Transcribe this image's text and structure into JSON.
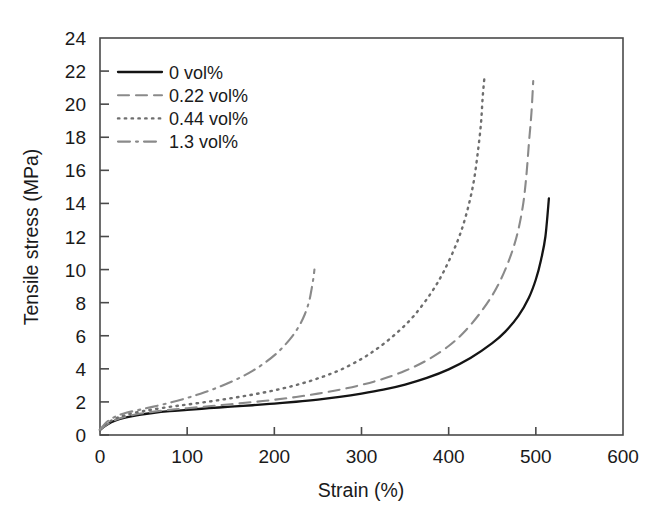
{
  "chart_data": {
    "type": "line",
    "title": "",
    "xlabel": "Strain (%)",
    "ylabel": "Tensile stress (MPa)",
    "xlim": [
      0,
      600
    ],
    "ylim": [
      0,
      24
    ],
    "xticks": [
      0,
      100,
      200,
      300,
      400,
      500,
      600
    ],
    "yticks": [
      0,
      2,
      4,
      6,
      8,
      10,
      12,
      14,
      16,
      18,
      20,
      22,
      24
    ],
    "xtick_labels": [
      "0",
      "100",
      "200",
      "300",
      "400",
      "500",
      "600"
    ],
    "ytick_labels": [
      "0",
      "2",
      "4",
      "6",
      "8",
      "10",
      "12",
      "14",
      "16",
      "18",
      "20",
      "22",
      "24"
    ],
    "grid": false,
    "legend_position": "upper left",
    "series": [
      {
        "name": "0 vol%",
        "style": "solid",
        "color": "#141414",
        "width": 2.3,
        "points": [
          [
            0,
            0.3
          ],
          [
            8,
            0.62
          ],
          [
            18,
            0.88
          ],
          [
            30,
            1.06
          ],
          [
            45,
            1.22
          ],
          [
            60,
            1.33
          ],
          [
            80,
            1.44
          ],
          [
            100,
            1.52
          ],
          [
            125,
            1.62
          ],
          [
            150,
            1.71
          ],
          [
            175,
            1.8
          ],
          [
            200,
            1.9
          ],
          [
            225,
            2.01
          ],
          [
            250,
            2.14
          ],
          [
            275,
            2.3
          ],
          [
            300,
            2.5
          ],
          [
            325,
            2.74
          ],
          [
            350,
            3.05
          ],
          [
            375,
            3.45
          ],
          [
            400,
            3.97
          ],
          [
            425,
            4.65
          ],
          [
            450,
            5.55
          ],
          [
            465,
            6.25
          ],
          [
            480,
            7.2
          ],
          [
            492,
            8.3
          ],
          [
            500,
            9.4
          ],
          [
            506,
            10.6
          ],
          [
            511,
            12.0
          ],
          [
            515,
            14.3
          ]
        ]
      },
      {
        "name": "0.22 vol%",
        "style": "dashed",
        "color": "#8a8a8a",
        "width": 2.1,
        "points": [
          [
            0,
            0.3
          ],
          [
            8,
            0.64
          ],
          [
            18,
            0.92
          ],
          [
            30,
            1.12
          ],
          [
            45,
            1.28
          ],
          [
            60,
            1.4
          ],
          [
            80,
            1.52
          ],
          [
            100,
            1.62
          ],
          [
            125,
            1.74
          ],
          [
            150,
            1.86
          ],
          [
            175,
            1.99
          ],
          [
            200,
            2.13
          ],
          [
            225,
            2.3
          ],
          [
            250,
            2.5
          ],
          [
            275,
            2.74
          ],
          [
            300,
            3.03
          ],
          [
            325,
            3.4
          ],
          [
            350,
            3.88
          ],
          [
            375,
            4.52
          ],
          [
            400,
            5.38
          ],
          [
            420,
            6.35
          ],
          [
            440,
            7.65
          ],
          [
            455,
            8.9
          ],
          [
            468,
            10.4
          ],
          [
            478,
            12.0
          ],
          [
            485,
            13.8
          ],
          [
            489,
            15.6
          ],
          [
            492,
            17.6
          ],
          [
            495,
            19.5
          ],
          [
            497,
            21.4
          ]
        ]
      },
      {
        "name": "0.44 vol%",
        "style": "dotted",
        "color": "#6e6e6e",
        "width": 2.4,
        "points": [
          [
            0,
            0.32
          ],
          [
            8,
            0.7
          ],
          [
            18,
            1.0
          ],
          [
            30,
            1.22
          ],
          [
            45,
            1.4
          ],
          [
            60,
            1.54
          ],
          [
            80,
            1.7
          ],
          [
            100,
            1.84
          ],
          [
            125,
            2.02
          ],
          [
            150,
            2.22
          ],
          [
            175,
            2.44
          ],
          [
            200,
            2.7
          ],
          [
            225,
            3.02
          ],
          [
            250,
            3.42
          ],
          [
            275,
            3.92
          ],
          [
            300,
            4.6
          ],
          [
            320,
            5.3
          ],
          [
            340,
            6.15
          ],
          [
            360,
            7.2
          ],
          [
            380,
            8.6
          ],
          [
            395,
            9.95
          ],
          [
            410,
            11.7
          ],
          [
            420,
            13.3
          ],
          [
            428,
            15.1
          ],
          [
            433,
            16.9
          ],
          [
            437,
            18.8
          ],
          [
            439,
            20.4
          ],
          [
            441,
            21.6
          ]
        ]
      },
      {
        "name": "1.3 vol%",
        "style": "dashdot",
        "color": "#8a8a8a",
        "width": 2.1,
        "points": [
          [
            0,
            0.34
          ],
          [
            8,
            0.8
          ],
          [
            18,
            1.12
          ],
          [
            30,
            1.34
          ],
          [
            45,
            1.52
          ],
          [
            60,
            1.7
          ],
          [
            80,
            1.95
          ],
          [
            100,
            2.24
          ],
          [
            120,
            2.58
          ],
          [
            140,
            2.98
          ],
          [
            160,
            3.45
          ],
          [
            175,
            3.88
          ],
          [
            190,
            4.4
          ],
          [
            205,
            5.05
          ],
          [
            218,
            5.8
          ],
          [
            228,
            6.55
          ],
          [
            235,
            7.3
          ],
          [
            240,
            8.1
          ],
          [
            243,
            8.9
          ],
          [
            245,
            9.55
          ],
          [
            246,
            10.0
          ]
        ]
      }
    ]
  },
  "legend": {
    "entries": [
      {
        "label": "0 vol%",
        "swatch": "solid-line-swatch"
      },
      {
        "label": "0.22 vol%",
        "swatch": "dashed-line-swatch"
      },
      {
        "label": "0.44 vol%",
        "swatch": "dotted-line-swatch"
      },
      {
        "label": "1.3 vol%",
        "swatch": "dashdot-line-swatch"
      }
    ]
  },
  "colors": {
    "axis": "#4a4a4a",
    "text": "#1a1a1a",
    "background": "#ffffff",
    "series_solid": "#141414",
    "series_dashed": "#8a8a8a",
    "series_dotted": "#6e6e6e",
    "series_dashdot": "#8a8a8a"
  }
}
